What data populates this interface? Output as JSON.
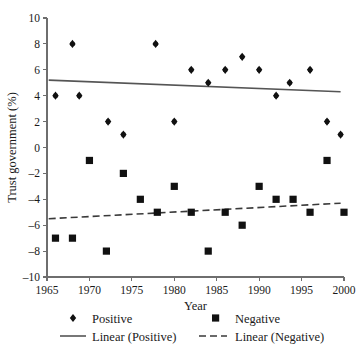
{
  "chart_data": {
    "type": "scatter",
    "title": "",
    "xlabel": "Year",
    "ylabel": "Trust government (%)",
    "xlim": [
      1965,
      2000
    ],
    "ylim": [
      -10,
      10
    ],
    "xticks": [
      1965,
      1970,
      1975,
      1980,
      1985,
      1990,
      1995,
      2000
    ],
    "xtick_labels": [
      "1965",
      "1970",
      "1975",
      "1980",
      "1985",
      "1990",
      "1995",
      "2000"
    ],
    "yticks": [
      -10,
      -8,
      -6,
      -4,
      -2,
      0,
      2,
      4,
      6,
      8,
      10
    ],
    "ytick_labels": [
      "–10",
      "–8",
      "–6",
      "–4",
      "–2",
      "0",
      "2",
      "4",
      "6",
      "8",
      "10"
    ],
    "grid": false,
    "legend_position": "bottom",
    "series": [
      {
        "name": "Positive",
        "marker": "diamond",
        "color": "#111111",
        "points": [
          [
            1966,
            4
          ],
          [
            1968,
            8
          ],
          [
            1968.8,
            4
          ],
          [
            1972.2,
            2
          ],
          [
            1974,
            1
          ],
          [
            1977.8,
            8
          ],
          [
            1980,
            2
          ],
          [
            1982,
            6
          ],
          [
            1984,
            5
          ],
          [
            1986,
            6
          ],
          [
            1988,
            7
          ],
          [
            1990,
            6
          ],
          [
            1992,
            4
          ],
          [
            1993.6,
            5
          ],
          [
            1996,
            6
          ],
          [
            1998,
            2
          ],
          [
            1999.6,
            1
          ]
        ]
      },
      {
        "name": "Negative",
        "marker": "square",
        "color": "#111111",
        "points": [
          [
            1966,
            -7
          ],
          [
            1968,
            -7
          ],
          [
            1970,
            -1
          ],
          [
            1972,
            -8
          ],
          [
            1974,
            -2
          ],
          [
            1976,
            -4
          ],
          [
            1978,
            -5
          ],
          [
            1980,
            -3
          ],
          [
            1982,
            -5
          ],
          [
            1984,
            -8
          ],
          [
            1986,
            -5
          ],
          [
            1988,
            -6
          ],
          [
            1990,
            -3
          ],
          [
            1992,
            -4
          ],
          [
            1994,
            -4
          ],
          [
            1996,
            -5
          ],
          [
            1998,
            -1
          ],
          [
            2000,
            -5
          ]
        ]
      }
    ],
    "trendlines": [
      {
        "name": "Linear (Positive)",
        "style": "solid",
        "color": "#555555",
        "x": [
          1965.2,
          1999.6
        ],
        "y": [
          5.2,
          4.3
        ]
      },
      {
        "name": "Linear (Negative)",
        "style": "dashed",
        "color": "#3a3a3a",
        "x": [
          1965.2,
          1999.6
        ],
        "y": [
          -5.5,
          -4.3
        ]
      }
    ]
  },
  "legend": {
    "items": [
      {
        "label": "Positive",
        "type": "marker",
        "marker": "diamond"
      },
      {
        "label": "Negative",
        "type": "marker",
        "marker": "square"
      },
      {
        "label": "Linear (Positive)",
        "type": "line",
        "style": "solid"
      },
      {
        "label": "Linear (Negative)",
        "type": "line",
        "style": "dashed"
      }
    ]
  }
}
